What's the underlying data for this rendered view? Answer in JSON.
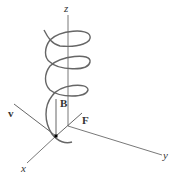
{
  "diagram": {
    "type": "3d-axes-helix",
    "labels": {
      "z": "z",
      "x": "x",
      "y": "y",
      "v": "v",
      "B": "B",
      "F": "F"
    },
    "colors": {
      "axis": "#555555",
      "helix": "#666666",
      "text": "#333333"
    }
  }
}
